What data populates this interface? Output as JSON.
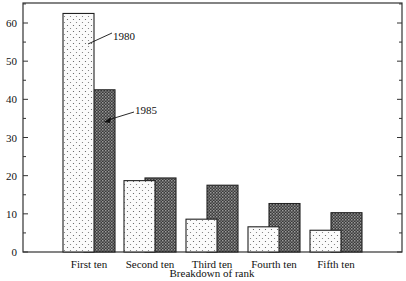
{
  "chart_data": {
    "type": "bar",
    "title": "",
    "xlabel": "Breakdown of rank",
    "ylabel": "",
    "ylim": [
      0,
      65
    ],
    "yticks": [
      0,
      10,
      20,
      30,
      40,
      50,
      60
    ],
    "categories": [
      "First ten",
      "Second ten",
      "Third ten",
      "Fourth ten",
      "Fifth ten"
    ],
    "series": [
      {
        "name": "1980",
        "pattern": "dotted-light",
        "values": [
          62.5,
          18.7,
          8.6,
          6.6,
          5.7
        ]
      },
      {
        "name": "1985",
        "pattern": "crosshatch-dark",
        "values": [
          42.5,
          19.4,
          17.5,
          12.7,
          10.3
        ]
      }
    ],
    "annotations": [
      {
        "text": "1980",
        "target": "First ten / 1980"
      },
      {
        "text": "1985",
        "target": "First ten / 1985"
      }
    ],
    "grid": false,
    "legend": "inline annotations"
  }
}
